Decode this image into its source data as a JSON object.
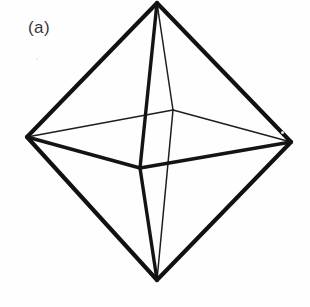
{
  "figure": {
    "panel_label": "(a)",
    "caption_text": "(a)",
    "background_color": "#fefefe",
    "ink_color": "#111111",
    "label_color": "#38383a",
    "canvas": {
      "width": 310,
      "height": 307
    }
  },
  "geometry": {
    "vertices": {
      "top": {
        "name": "top-apex",
        "x": 157,
        "y": 3
      },
      "bottom": {
        "name": "bottom-apex",
        "x": 157,
        "y": 280
      },
      "left": {
        "name": "left-vertex",
        "x": 27,
        "y": 137
      },
      "right": {
        "name": "right-vertex",
        "x": 291,
        "y": 142
      },
      "front": {
        "name": "front-vertex",
        "x": 140,
        "y": 168
      },
      "back": {
        "name": "back-vertex",
        "x": 173,
        "y": 110
      }
    },
    "edges": [
      {
        "name": "edge-top-left",
        "from": "top",
        "to": "left",
        "weight": "thick"
      },
      {
        "name": "edge-top-right",
        "from": "top",
        "to": "right",
        "weight": "thick"
      },
      {
        "name": "edge-bottom-left",
        "from": "bottom",
        "to": "left",
        "weight": "thick"
      },
      {
        "name": "edge-bottom-right",
        "from": "bottom",
        "to": "right",
        "weight": "thick"
      },
      {
        "name": "edge-top-front",
        "from": "top",
        "to": "front",
        "weight": "medium"
      },
      {
        "name": "edge-bottom-front",
        "from": "bottom",
        "to": "front",
        "weight": "medium"
      },
      {
        "name": "edge-left-front",
        "from": "left",
        "to": "front",
        "weight": "medium"
      },
      {
        "name": "edge-right-front",
        "from": "right",
        "to": "front",
        "weight": "medium"
      },
      {
        "name": "edge-top-back",
        "from": "top",
        "to": "back",
        "weight": "thin"
      },
      {
        "name": "edge-bottom-back",
        "from": "bottom",
        "to": "back",
        "weight": "thin"
      },
      {
        "name": "edge-left-back",
        "from": "left",
        "to": "back",
        "weight": "thin"
      },
      {
        "name": "edge-right-back",
        "from": "right",
        "to": "back",
        "weight": "thin"
      }
    ]
  }
}
